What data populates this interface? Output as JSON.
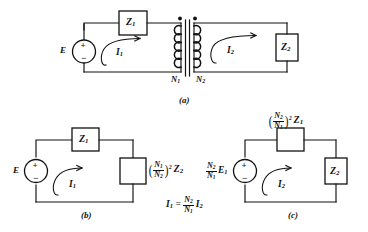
{
  "figure": {
    "ink_color": "#111111",
    "background": "#ffffff"
  },
  "panels": [
    {
      "id": "a",
      "caption": "(a)",
      "description": "Transformer circuit with primary source and secondary load",
      "source_label": "E",
      "source_plus": "+",
      "source_minus": "−",
      "z1_label": "Z",
      "z1_sub": "1",
      "z2_label": "Z",
      "z2_sub": "2",
      "current_primary": "I",
      "current_primary_sub": "1",
      "current_secondary": "I",
      "current_secondary_sub": "2",
      "winding_primary": "N",
      "winding_primary_sub": "1",
      "winding_secondary": "N",
      "winding_secondary_sub": "2"
    },
    {
      "id": "b",
      "caption": "(b)",
      "description": "Secondary impedance referred to the primary side",
      "source_label": "E",
      "source_plus": "+",
      "source_minus": "−",
      "z1_label": "Z",
      "z1_sub": "1",
      "load_num": "N",
      "load_num_sub": "1",
      "load_den": "N",
      "load_den_sub": "2",
      "load_exponent": "2",
      "load_impedance": "Z",
      "load_impedance_sub": "2",
      "current_label": "I",
      "current_sub": "1"
    },
    {
      "id": "c",
      "caption": "(c)",
      "description": "Primary impedance and source referred to the secondary side",
      "source_num": "N",
      "source_num_sub": "2",
      "source_den": "N",
      "source_den_sub": "1",
      "source_label": "E",
      "source_label_sub": "1",
      "source_plus": "+",
      "source_minus": "−",
      "top_num": "N",
      "top_num_sub": "2",
      "top_den": "N",
      "top_den_sub": "1",
      "top_exponent": "2",
      "top_impedance": "Z",
      "top_impedance_sub": "1",
      "z2_label": "Z",
      "z2_sub": "2",
      "current_label": "I",
      "current_sub": "2"
    }
  ],
  "equation": {
    "lhs": "I",
    "lhs_sub": "1",
    "equals": "=",
    "ratio_num": "N",
    "ratio_num_sub": "2",
    "ratio_den": "N",
    "ratio_den_sub": "1",
    "rhs": "I",
    "rhs_sub": "2"
  }
}
